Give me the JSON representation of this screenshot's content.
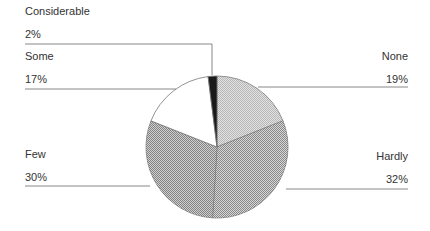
{
  "chart_data": {
    "type": "pie",
    "title": "",
    "slices": [
      {
        "label": "None",
        "value": 19,
        "pct_label": "19%",
        "fill": "#d8d8d8"
      },
      {
        "label": "Hardly",
        "value": 32,
        "pct_label": "32%",
        "fill": "#b4b4b4"
      },
      {
        "label": "Few",
        "value": 30,
        "pct_label": "30%",
        "fill": "#a8a8a8"
      },
      {
        "label": "Some",
        "value": 17,
        "pct_label": "17%",
        "fill": "#ffffff"
      },
      {
        "label": "Considerable",
        "value": 2,
        "pct_label": "2%",
        "fill": "#1a1a1a"
      }
    ],
    "legend": "none (leader-line labels)",
    "start_angle_deg": 0,
    "direction": "clockwise"
  },
  "labels": {
    "none": {
      "name": "None",
      "pct": "19%"
    },
    "hardly": {
      "name": "Hardly",
      "pct": "32%"
    },
    "few": {
      "name": "Few",
      "pct": "30%"
    },
    "some": {
      "name": "Some",
      "pct": "17%"
    },
    "considerable": {
      "name": "Considerable",
      "pct": "2%"
    }
  }
}
